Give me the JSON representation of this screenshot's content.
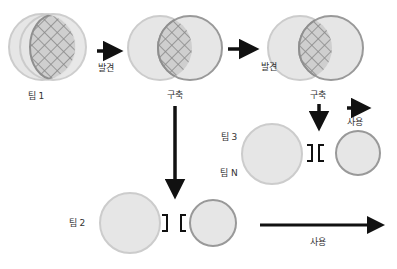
{
  "diagram": {
    "colors": {
      "circle_fill": "#e6e6e6",
      "circle_stroke_light": "#c9c9c9",
      "circle_stroke_dark": "#999999",
      "hatch": "#8a8a8a",
      "arrow": "#111111",
      "text": "#333333"
    },
    "teams": [
      {
        "id": "team1",
        "label": "팀 1"
      },
      {
        "id": "team2",
        "label": "팀 2"
      },
      {
        "id": "team3",
        "label": "팀 3"
      },
      {
        "id": "teamN",
        "label": "팀 N"
      }
    ],
    "stages": [
      {
        "label": "구축"
      },
      {
        "label": "구축"
      }
    ],
    "arrows": [
      {
        "label": "발견"
      },
      {
        "label": "발견"
      },
      {
        "label": "사용"
      },
      {
        "label": "사용"
      }
    ],
    "connectors": [
      {
        "symbol": "interface-connector"
      },
      {
        "symbol": "interface-connector"
      }
    ]
  }
}
